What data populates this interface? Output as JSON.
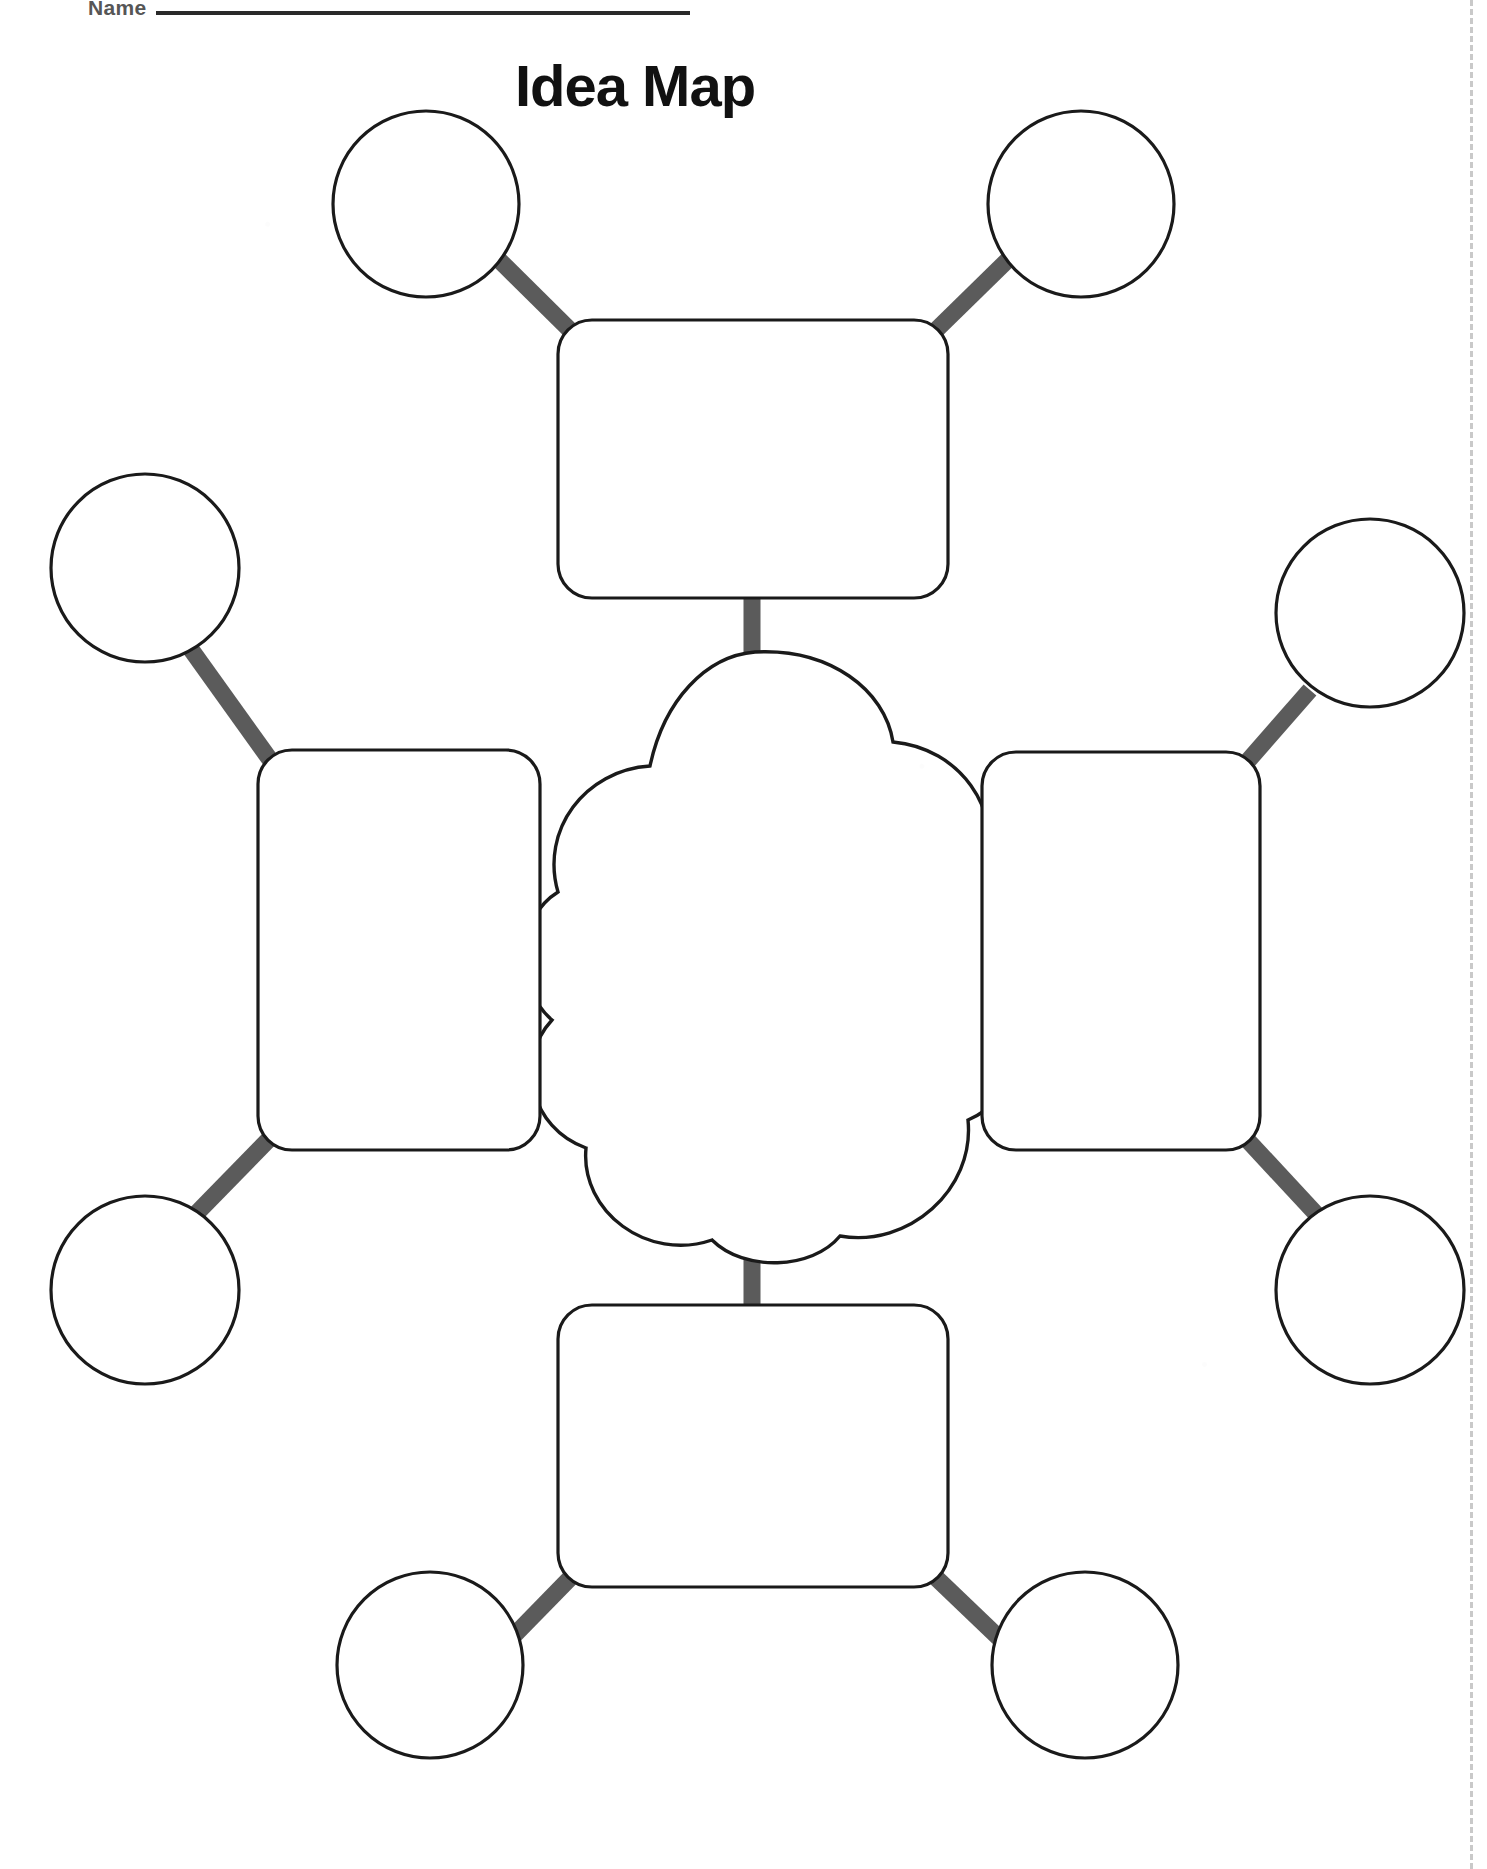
{
  "page": {
    "title": "Idea Map",
    "name_field_label": "Name",
    "background_color": "#ffffff",
    "width": 1487,
    "height": 1869
  },
  "worksheet": {
    "type": "graphic-organizer",
    "center_shape": "cloud",
    "center_text": "",
    "branch_count": 4,
    "leaves_per_branch": 2,
    "outline_color": "#1a1a1a",
    "connector_color": "#5b5b5b",
    "perforation_color": "#c9c9c9",
    "branches": [
      {
        "id": "top",
        "shape": "rounded-rect",
        "text": "",
        "leaves": [
          {
            "id": "top-left",
            "shape": "circle",
            "text": ""
          },
          {
            "id": "top-right",
            "shape": "circle",
            "text": ""
          }
        ]
      },
      {
        "id": "left",
        "shape": "rounded-rect",
        "text": "",
        "leaves": [
          {
            "id": "left-upper",
            "shape": "circle",
            "text": ""
          },
          {
            "id": "left-lower",
            "shape": "circle",
            "text": ""
          }
        ]
      },
      {
        "id": "right",
        "shape": "rounded-rect",
        "text": "",
        "leaves": [
          {
            "id": "right-upper",
            "shape": "circle",
            "text": ""
          },
          {
            "id": "right-lower",
            "shape": "circle",
            "text": ""
          }
        ]
      },
      {
        "id": "bottom",
        "shape": "rounded-rect",
        "text": "",
        "leaves": [
          {
            "id": "bottom-left",
            "shape": "circle",
            "text": ""
          },
          {
            "id": "bottom-right",
            "shape": "circle",
            "text": ""
          }
        ]
      }
    ]
  }
}
